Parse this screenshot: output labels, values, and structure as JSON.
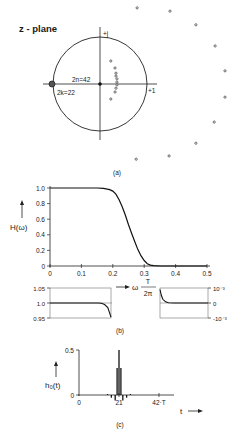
{
  "figure": {
    "captions": [
      "(a)",
      "(b)",
      "(c)"
    ]
  },
  "chart_data": [
    {
      "type": "scatter",
      "panel": "(a)",
      "title": "z - plane",
      "axes": {
        "real_label": "+1",
        "imag_label": "+j"
      },
      "unit_circle": true,
      "annotations": [
        {
          "text": "2n=42",
          "meaning": "42-fold pole/zero at origin"
        },
        {
          "text": "2k=22",
          "meaning": "22-fold zero at z = -1"
        }
      ],
      "origin_point": {
        "re": 0,
        "im": 0,
        "label": "2n=42"
      },
      "zero_cluster": {
        "re": -1,
        "im": 0,
        "label": "2k=22"
      },
      "inner_poles": [
        {
          "re": 0.23,
          "im": 0.49
        },
        {
          "re": 0.32,
          "im": 0.34
        },
        {
          "re": 0.34,
          "im": 0.23
        },
        {
          "re": 0.34,
          "im": 0.17
        },
        {
          "re": 0.36,
          "im": 0.11
        },
        {
          "re": 0.36,
          "im": 0.04
        },
        {
          "re": 0.36,
          "im": -0.02
        },
        {
          "re": 0.34,
          "im": -0.09
        },
        {
          "re": 0.32,
          "im": -0.17
        },
        {
          "re": 0.23,
          "im": -0.32
        }
      ],
      "outer_poles": [
        {
          "re": 0.79,
          "im": 1.62
        },
        {
          "re": 1.49,
          "im": 1.55
        },
        {
          "re": 2.04,
          "im": 1.26
        },
        {
          "re": 2.45,
          "im": 0.81
        },
        {
          "re": 2.66,
          "im": 0.28
        },
        {
          "re": 2.66,
          "im": -0.28
        },
        {
          "re": 2.43,
          "im": -0.81
        },
        {
          "re": 2.04,
          "im": -1.26
        },
        {
          "re": 1.47,
          "im": -1.53
        },
        {
          "re": 0.77,
          "im": -1.6
        }
      ]
    },
    {
      "type": "line",
      "panel": "(b) main",
      "ylabel": "H(ω)",
      "xlabel": "ω T/2π",
      "xlim": [
        0,
        0.5
      ],
      "ylim": [
        0,
        1.0
      ],
      "xticks": [
        "0",
        "0.1",
        "0.2",
        "0.3",
        "0.4",
        "0.5"
      ],
      "yticks": [
        "0",
        "0.2",
        "0.4",
        "0.6",
        "0.8",
        "1.0"
      ],
      "grid": false,
      "x": [
        0,
        0.05,
        0.1,
        0.15,
        0.17,
        0.19,
        0.2,
        0.21,
        0.22,
        0.23,
        0.24,
        0.25,
        0.26,
        0.27,
        0.28,
        0.29,
        0.3,
        0.31,
        0.32,
        0.33,
        0.35,
        0.4,
        0.45,
        0.5
      ],
      "values": [
        1.0,
        1.0,
        1.0,
        1.0,
        0.995,
        0.98,
        0.96,
        0.92,
        0.85,
        0.76,
        0.65,
        0.53,
        0.42,
        0.31,
        0.21,
        0.13,
        0.07,
        0.03,
        0.012,
        0.004,
        0.0,
        0.0,
        0.0,
        0.0
      ]
    },
    {
      "type": "line",
      "panel": "(b) passband detail",
      "xlim": [
        0,
        0.19
      ],
      "ylim": [
        0.95,
        1.05
      ],
      "yticks": [
        "0.95",
        "1.0",
        "1.05"
      ],
      "x": [
        0,
        0.1,
        0.15,
        0.16,
        0.17,
        0.18,
        0.19
      ],
      "values": [
        1.0,
        1.0,
        1.0,
        0.999,
        0.995,
        0.985,
        0.953
      ]
    },
    {
      "type": "line",
      "panel": "(b) stopband detail",
      "xlim": [
        0.33,
        0.5
      ],
      "ylim": [
        -0.001,
        0.001
      ],
      "yticks": [
        "-10⁻³",
        "0",
        "10⁻³"
      ],
      "x": [
        0.33,
        0.335,
        0.34,
        0.35,
        0.36,
        0.38,
        0.5
      ],
      "values": [
        0.0009,
        0.0005,
        0.00025,
        8e-05,
        2e-05,
        0.0,
        0.0
      ]
    },
    {
      "type": "bar",
      "panel": "(c)",
      "ylabel": "h₀(t)",
      "xlabel": "t",
      "xlim": [
        0,
        42
      ],
      "ylim": [
        0,
        0.5
      ],
      "xticks": [
        "0",
        "21",
        "42·T"
      ],
      "yticks": [
        "0",
        "0.5"
      ],
      "categories": [
        15,
        17,
        19,
        20,
        21,
        22,
        23,
        25,
        27
      ],
      "values": [
        0.01,
        -0.03,
        -0.06,
        0.3,
        0.5,
        0.3,
        -0.06,
        -0.03,
        0.01
      ]
    }
  ]
}
